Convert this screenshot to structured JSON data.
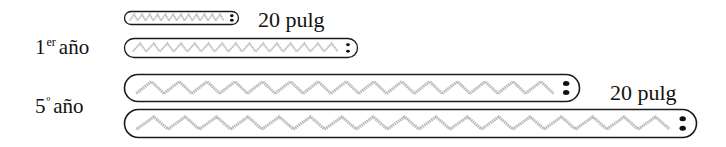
{
  "rows": [
    {
      "id": "year1",
      "label_main": "1",
      "label_sup": "er",
      "label_word": "año",
      "worms": [
        {
          "name": "worm-year1-short",
          "x": 124,
          "y": 11,
          "w": 114,
          "h": 13,
          "segments": 12
        },
        {
          "name": "worm-year1-long",
          "x": 124,
          "y": 38,
          "w": 233,
          "h": 19,
          "segments": 15
        }
      ],
      "measure": "20 pulg"
    },
    {
      "id": "year5",
      "label_main": "5",
      "label_sup": "º",
      "label_word": "año",
      "worms": [
        {
          "name": "worm-year5-short",
          "x": 124,
          "y": 74,
          "w": 455,
          "h": 27,
          "segments": 15
        },
        {
          "name": "worm-year5-long",
          "x": 124,
          "y": 109,
          "w": 572,
          "h": 28,
          "segments": 17
        }
      ],
      "measure": "20 pulg"
    }
  ],
  "colors": {
    "outline": "#1a1a1a",
    "body_pattern": "#b8b8b8",
    "eyes": "#111111"
  }
}
